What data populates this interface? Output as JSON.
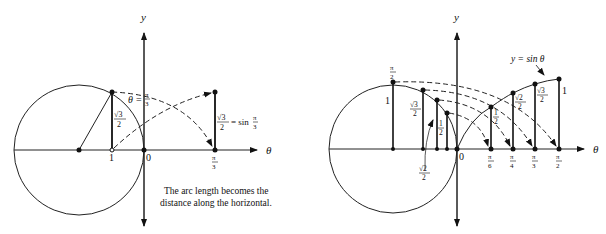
{
  "figure": {
    "left_panel": {
      "axis_labels": {
        "y": "y",
        "x": "θ"
      },
      "origin_label": "0",
      "unit_label": "1",
      "angle_label": {
        "theta": "θ",
        "equals": "=",
        "num": "π",
        "den": "3"
      },
      "height_label": {
        "num": "√3",
        "den": "2"
      },
      "result_label": {
        "num": "√3",
        "den": "2",
        "eq": "= sin",
        "frac_num": "π",
        "frac_den": "3"
      },
      "tick_label": {
        "num": "π",
        "den": "3"
      },
      "caption": [
        "The arc length becomes the",
        "distance along the horizontal."
      ]
    },
    "right_panel": {
      "axis_labels": {
        "y": "y",
        "x": "θ"
      },
      "origin_label": "0",
      "curve_label": "y = sin θ",
      "circle_labels": {
        "top": {
          "num": "π",
          "den": "2"
        },
        "one": "1",
        "sqrt3": {
          "num": "√3",
          "den": "2"
        },
        "sqrt2": {
          "num": "√2",
          "den": "2"
        },
        "half": {
          "num": "1",
          "den": "2"
        }
      },
      "curve_heights": [
        {
          "num": "1",
          "den": "2"
        },
        {
          "num": "√2",
          "den": "2"
        },
        {
          "num": "√3",
          "den": "2"
        },
        {
          "value": "1"
        }
      ],
      "ticks": [
        {
          "num": "π",
          "den": "6"
        },
        {
          "num": "π",
          "den": "4"
        },
        {
          "num": "π",
          "den": "3"
        },
        {
          "num": "π",
          "den": "2"
        }
      ]
    }
  }
}
